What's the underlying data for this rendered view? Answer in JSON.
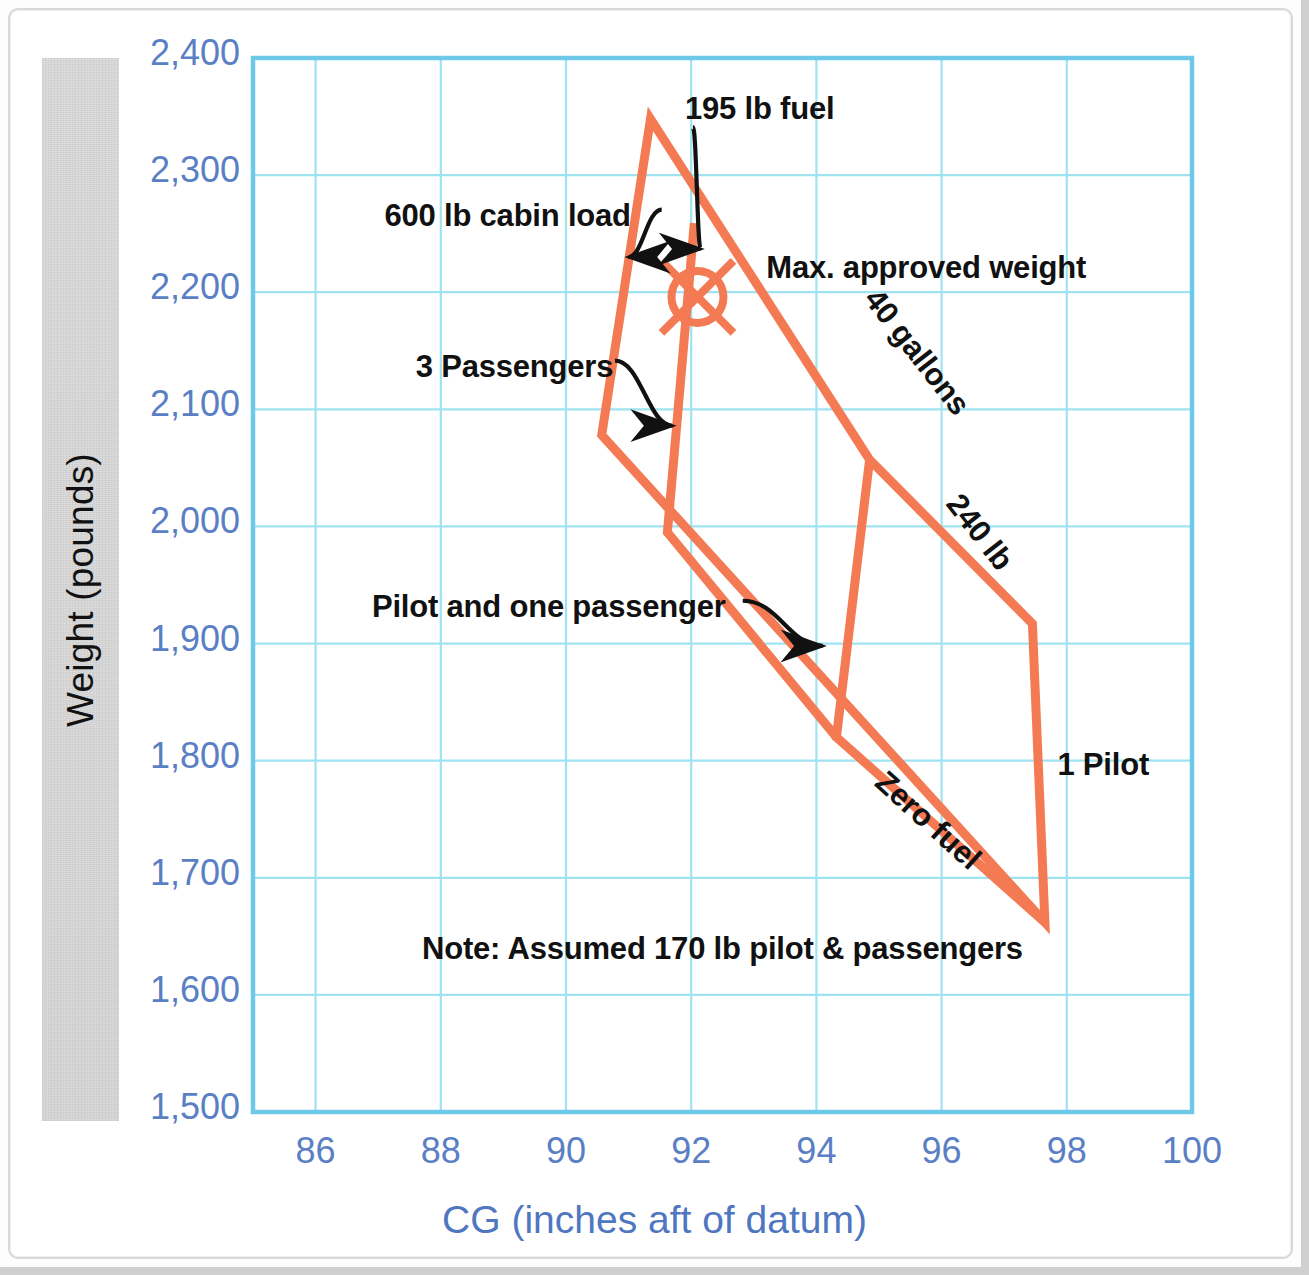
{
  "figure": {
    "y_axis_title": "Weight (pounds)",
    "x_axis_title": "CG (inches aft of datum)",
    "note": "Note: Assumed 170 lb pilot & passengers",
    "grid_color": "#9fe3f2",
    "axis_color": "#6ec9e8",
    "tick_label_color": "#5a7fc4",
    "envelope_color": "#f47a54",
    "annotation_color": "#111111"
  },
  "chart_data": {
    "type": "line",
    "title": "",
    "subtitle": "",
    "xlabel": "CG (inches aft of datum)",
    "ylabel": "Weight (pounds)",
    "xlim": [
      85,
      100
    ],
    "ylim": [
      1500,
      2400
    ],
    "grid": true,
    "legend": "none",
    "x_ticks": [
      86,
      88,
      90,
      92,
      94,
      96,
      98,
      100
    ],
    "x_tick_labels": [
      "86",
      "88",
      "90",
      "92",
      "94",
      "96",
      "98",
      "100"
    ],
    "y_ticks": [
      1500,
      1600,
      1700,
      1800,
      1900,
      2000,
      2100,
      2200,
      2300,
      2400
    ],
    "y_tick_labels": [
      "1,500",
      "1,600",
      "1,700",
      "1,800",
      "1,900",
      "2,000",
      "2,100",
      "2,200",
      "2,300",
      "2,400"
    ],
    "series": [
      {
        "name": "Loading envelope outline",
        "closed": true,
        "points": [
          [
            91.35,
            2348
          ],
          [
            94.85,
            2057
          ],
          [
            97.45,
            1917
          ],
          [
            97.65,
            1662
          ],
          [
            90.57,
            2078
          ],
          [
            91.35,
            2348
          ]
        ]
      },
      {
        "name": "Cabin load / zero fuel inner line",
        "closed": false,
        "points": [
          [
            92.05,
            2259
          ],
          [
            91.62,
            1995
          ],
          [
            94.32,
            1820
          ]
        ]
      },
      {
        "name": "1 Pilot inner line",
        "closed": false,
        "points": [
          [
            94.85,
            2057
          ],
          [
            94.32,
            1820
          ],
          [
            97.65,
            1662
          ]
        ]
      }
    ],
    "markers": [
      {
        "name": "loaded-cg-point",
        "symbol": "circle-with-cross",
        "x": 92.1,
        "y": 2196,
        "color": "#f47a54"
      }
    ],
    "annotations": [
      {
        "name": "600-lb-cabin-load",
        "text": "600 lb cabin load",
        "x": 87.1,
        "y": 2262,
        "arrow_to": [
          91.0,
          2230
        ]
      },
      {
        "name": "195-lb-fuel",
        "text": "195 lb fuel",
        "x": 91.9,
        "y": 2353,
        "arrow_to": [
          92.15,
          2237
        ]
      },
      {
        "name": "max-approved-weight",
        "text": "Max. approved weight",
        "x": 93.2,
        "y": 2217,
        "arrow_to": null
      },
      {
        "name": "3-passengers",
        "text": "3 Passengers",
        "x": 87.6,
        "y": 2133,
        "arrow_to": [
          91.7,
          2086
        ]
      },
      {
        "name": "40-gallons",
        "text": "40 gallons",
        "x": 95.1,
        "y": 2190,
        "rotation": 52
      },
      {
        "name": "240-lb",
        "text": "240 lb",
        "x": 96.4,
        "y": 2015,
        "rotation": 52
      },
      {
        "name": "pilot-and-one-passenger",
        "text": "Pilot and one passenger",
        "x": 86.9,
        "y": 1928,
        "arrow_to": [
          94.1,
          1898
        ]
      },
      {
        "name": "zero-fuel",
        "text": "Zero fuel",
        "x": 95.2,
        "y": 1778,
        "rotation": 42
      },
      {
        "name": "1-pilot",
        "text": "1 Pilot",
        "x": 97.85,
        "y": 1793
      },
      {
        "name": "note",
        "text": "Note: Assumed 170 lb pilot & passengers",
        "x": 87.7,
        "y": 1636
      }
    ]
  }
}
